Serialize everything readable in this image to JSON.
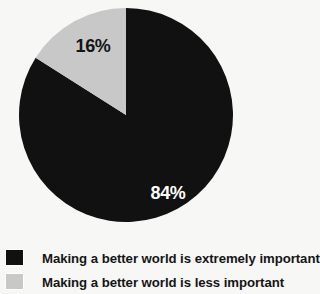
{
  "chart_data": {
    "type": "pie",
    "title": "",
    "subtitle": "",
    "xlabel": "",
    "ylabel": "",
    "grid": false,
    "legend_position": "bottom-left",
    "background_color": "#f7f7f5",
    "center": {
      "x": 126,
      "y": 115
    },
    "radius": 107,
    "start_angle_deg": 0,
    "direction": "clockwise",
    "categories": [
      "Making a better world is extremely important",
      "Making a better world is less important"
    ],
    "values": [
      84,
      16
    ],
    "value_labels": [
      "84%",
      "16%"
    ],
    "colors": [
      "#111111",
      "#c8c8c8"
    ],
    "label_colors": [
      "#ffffff",
      "#141414"
    ],
    "slices": [
      {
        "label": "Making a better world is extremely important",
        "value": 84,
        "value_label": "84%",
        "color": "#111111",
        "label_color": "#ffffff",
        "start_deg": 0,
        "end_deg": 302.4
      },
      {
        "label": "Making a better world is less important",
        "value": 16,
        "value_label": "16%",
        "color": "#c8c8c8",
        "label_color": "#141414",
        "start_deg": 302.4,
        "end_deg": 360
      }
    ]
  },
  "pie": {
    "major_value_label": "84%",
    "minor_value_label": "16%"
  },
  "legend": {
    "items": [
      {
        "label": "Making a better world is extremely important",
        "color": "#111111",
        "swatch_name": "legend-swatch-extremely-important"
      },
      {
        "label": "Making a better world is less important",
        "color": "#c8c8c8",
        "swatch_name": "legend-swatch-less-important"
      }
    ]
  }
}
